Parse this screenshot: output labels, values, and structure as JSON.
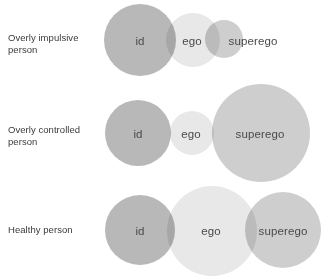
{
  "diagram": {
    "background_color": "#ffffff",
    "colors": {
      "id": "#b8b8b8",
      "ego": "#e8e8e8",
      "superego": "#cecece",
      "label_text": "#3a3a3a",
      "circle_text": "#4a4a4a"
    },
    "rows": [
      {
        "label": "Overly impulsive\nperson",
        "label_y": 32,
        "row_top": 0,
        "circles": [
          {
            "name": "id",
            "label": "id",
            "cx": 140,
            "cy": 40,
            "r": 36,
            "color": "#b8b8b8"
          },
          {
            "name": "ego",
            "label": "ego",
            "cx": 193,
            "cy": 40,
            "r": 27,
            "color": "#e8e8e8"
          },
          {
            "name": "superego",
            "label": "superego",
            "cx": 224,
            "cy": 39,
            "r": 19,
            "color": "#cecece"
          }
        ],
        "text_positions": [
          {
            "name": "id",
            "x": 140,
            "y": 41
          },
          {
            "name": "ego",
            "x": 192,
            "y": 41
          },
          {
            "name": "superego",
            "x": 253,
            "y": 41
          }
        ]
      },
      {
        "label": "Overly controlled\nperson",
        "label_y": 124,
        "row_top": 88,
        "circles": [
          {
            "name": "id",
            "label": "id",
            "cx": 138,
            "cy": 45,
            "r": 33,
            "color": "#b8b8b8"
          },
          {
            "name": "ego",
            "label": "ego",
            "cx": 192,
            "cy": 45,
            "r": 22,
            "color": "#e8e8e8"
          },
          {
            "name": "superego",
            "label": "superego",
            "cx": 261,
            "cy": 45,
            "r": 49,
            "color": "#cecece"
          }
        ],
        "text_positions": [
          {
            "name": "id",
            "x": 138,
            "y": 46
          },
          {
            "name": "ego",
            "x": 191,
            "y": 46
          },
          {
            "name": "superego",
            "x": 260,
            "y": 46
          }
        ]
      },
      {
        "label": "Healthy person",
        "label_y": 224,
        "row_top": 183,
        "circles": [
          {
            "name": "id",
            "label": "id",
            "cx": 140,
            "cy": 47,
            "r": 35,
            "color": "#b8b8b8"
          },
          {
            "name": "ego",
            "label": "ego",
            "cx": 212,
            "cy": 48,
            "r": 45,
            "color": "#e8e8e8"
          },
          {
            "name": "superego",
            "label": "superego",
            "cx": 283,
            "cy": 47,
            "r": 38,
            "color": "#cecece"
          }
        ],
        "text_positions": [
          {
            "name": "id",
            "x": 140,
            "y": 48
          },
          {
            "name": "ego",
            "x": 211,
            "y": 48
          },
          {
            "name": "superego",
            "x": 283,
            "y": 48
          }
        ]
      }
    ]
  }
}
